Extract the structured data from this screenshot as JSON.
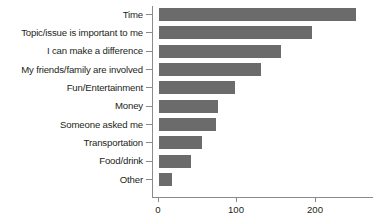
{
  "chart_data": {
    "type": "bar",
    "orientation": "horizontal",
    "title": "",
    "subtitle": "",
    "xlabel": "",
    "ylabel": "",
    "categories": [
      "Time",
      "Topic/issue is important to me",
      "I can make a difference",
      "My friends/family are involved",
      "Fun/Entertainment",
      "Money",
      "Someone asked me",
      "Transportation",
      "Food/drink",
      "Other"
    ],
    "values": [
      252,
      196,
      157,
      131,
      98,
      76,
      73,
      55,
      41,
      17
    ],
    "xlim": [
      0,
      276
    ],
    "xticks": [
      0,
      100,
      200
    ],
    "xtick_labels": [
      "0",
      "100",
      "200"
    ],
    "grid": false,
    "legend": null,
    "bar_color": "#6b6b6b",
    "axis_color": "#8a8a8a",
    "text_color": "#231f20",
    "background_color": "#ffffff"
  }
}
